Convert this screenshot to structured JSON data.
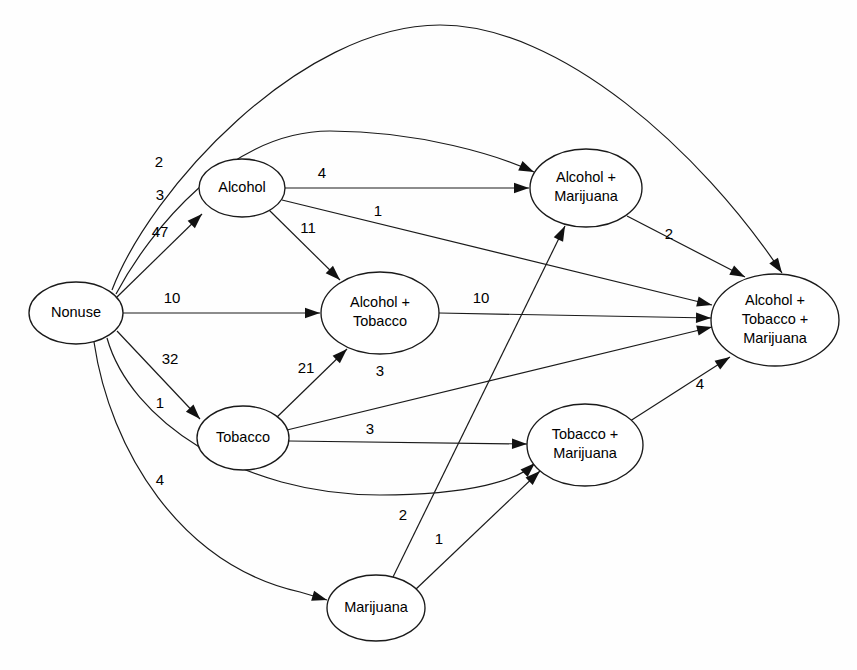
{
  "figure": {
    "type": "directed-transition-graph",
    "background_color": "#fefefe",
    "line_color": "#1a1a1a",
    "text_color": "#000000"
  },
  "nodes": [
    {
      "id": "nonuse",
      "label": "Nonuse",
      "lines": [
        "Nonuse"
      ],
      "cx": 76,
      "cy": 313,
      "rx": 47,
      "ry": 31
    },
    {
      "id": "alcohol",
      "label": "Alcohol",
      "lines": [
        "Alcohol"
      ],
      "cx": 242,
      "cy": 188,
      "rx": 43,
      "ry": 29
    },
    {
      "id": "alc_tob",
      "label": "Alcohol + Tobacco",
      "lines": [
        "Alcohol +",
        "Tobacco"
      ],
      "cx": 380,
      "cy": 313,
      "rx": 59,
      "ry": 41
    },
    {
      "id": "alc_mar",
      "label": "Alcohol + Marijuana",
      "lines": [
        "Alcohol +",
        "Marijuana"
      ],
      "cx": 586,
      "cy": 188,
      "rx": 56,
      "ry": 39
    },
    {
      "id": "atm",
      "label": "Alcohol + Tobacco + Marijuana",
      "lines": [
        "Alcohol +",
        "Tobacco +",
        "Marijuana"
      ],
      "cx": 775,
      "cy": 320,
      "rx": 64,
      "ry": 46
    },
    {
      "id": "tobacco",
      "label": "Tobacco",
      "lines": [
        "Tobacco"
      ],
      "cx": 243,
      "cy": 438,
      "rx": 46,
      "ry": 32
    },
    {
      "id": "tob_mar",
      "label": "Tobacco + Marijuana",
      "lines": [
        "Tobacco +",
        "Marijuana"
      ],
      "cx": 585,
      "cy": 445,
      "rx": 58,
      "ry": 41
    },
    {
      "id": "marijuana",
      "label": "Marijuana",
      "lines": [
        "Marijuana"
      ],
      "cx": 376,
      "cy": 608,
      "rx": 49,
      "ry": 33
    }
  ],
  "edges": [
    {
      "id": "e1",
      "from": "nonuse",
      "to": "atm",
      "value": "2",
      "label_x": 159,
      "label_y": 163,
      "d": "M 112,290 C 150,190 300,25 440,25 C 560,25 700,150 782,273"
    },
    {
      "id": "e2",
      "from": "nonuse",
      "to": "alc_mar",
      "value": "3",
      "label_x": 160,
      "label_y": 196,
      "d": "M 116,294 C 150,230 230,131 330,131 C 420,131 500,156 534,172"
    },
    {
      "id": "e3",
      "from": "nonuse",
      "to": "alcohol",
      "value": "47",
      "label_x": 160,
      "label_y": 233,
      "d": "M 117,297 L 202,214"
    },
    {
      "id": "e4",
      "from": "nonuse",
      "to": "alc_tob",
      "value": "10",
      "label_x": 172,
      "label_y": 299,
      "d": "M 123,313 L 320,313"
    },
    {
      "id": "e5",
      "from": "nonuse",
      "to": "tobacco",
      "value": "32",
      "label_x": 170,
      "label_y": 360,
      "d": "M 117,331 L 200,419"
    },
    {
      "id": "e6",
      "from": "nonuse",
      "to": "tob_mar",
      "value": "1",
      "label_x": 160,
      "label_y": 404,
      "d": "M 107,338 C 130,420 240,495 380,495 C 470,495 520,480 535,463"
    },
    {
      "id": "e7",
      "from": "nonuse",
      "to": "marijuana",
      "value": "4",
      "label_x": 160,
      "label_y": 481,
      "d": "M 94,342 C 110,450 180,565 300,592 L 327,600"
    },
    {
      "id": "e8",
      "from": "alcohol",
      "to": "alc_mar",
      "value": "4",
      "label_x": 322,
      "label_y": 174,
      "d": "M 285,188 L 529,188"
    },
    {
      "id": "e9",
      "from": "alcohol",
      "to": "atm",
      "value": "1",
      "label_x": 378,
      "label_y": 212,
      "d": "M 282,200 L 712,305"
    },
    {
      "id": "e10",
      "from": "alcohol",
      "to": "alc_tob",
      "value": "11",
      "label_x": 308,
      "label_y": 229,
      "d": "M 268,209 L 340,280"
    },
    {
      "id": "e11",
      "from": "alc_tob",
      "to": "atm",
      "value": "10",
      "label_x": 481,
      "label_y": 299,
      "d": "M 439,313 L 711,318"
    },
    {
      "id": "e12",
      "from": "alc_mar",
      "to": "atm",
      "value": "2",
      "label_x": 669,
      "label_y": 235,
      "d": "M 627,216 L 745,277"
    },
    {
      "id": "e13",
      "from": "tobacco",
      "to": "alc_tob",
      "value": "21",
      "label_x": 306,
      "label_y": 369,
      "d": "M 275,419 L 347,349"
    },
    {
      "id": "e14",
      "from": "tobacco",
      "to": "atm",
      "value": "3",
      "label_x": 380,
      "label_y": 372,
      "d": "M 287,430 L 712,327"
    },
    {
      "id": "e15",
      "from": "tobacco",
      "to": "tob_mar",
      "value": "3",
      "label_x": 370,
      "label_y": 430,
      "d": "M 289,441 L 527,444"
    },
    {
      "id": "e16",
      "from": "tob_mar",
      "to": "atm",
      "value": "4",
      "label_x": 700,
      "label_y": 385,
      "d": "M 627,423 L 730,357"
    },
    {
      "id": "e17",
      "from": "marijuana",
      "to": "alc_mar",
      "value": "2",
      "label_x": 403,
      "label_y": 516,
      "d": "M 393,577 L 565,226"
    },
    {
      "id": "e18",
      "from": "marijuana",
      "to": "tob_mar",
      "value": "1",
      "label_x": 439,
      "label_y": 540,
      "d": "M 415,590 L 540,471"
    }
  ],
  "chart_data": {
    "type": "diagram",
    "title": "",
    "states": [
      "Nonuse",
      "Alcohol",
      "Tobacco",
      "Marijuana",
      "Alcohol + Tobacco",
      "Alcohol + Marijuana",
      "Tobacco + Marijuana",
      "Alcohol + Tobacco + Marijuana"
    ],
    "transitions": [
      {
        "source": "Nonuse",
        "target": "Alcohol + Tobacco + Marijuana",
        "count": 2
      },
      {
        "source": "Nonuse",
        "target": "Alcohol + Marijuana",
        "count": 3
      },
      {
        "source": "Nonuse",
        "target": "Alcohol",
        "count": 47
      },
      {
        "source": "Nonuse",
        "target": "Alcohol + Tobacco",
        "count": 10
      },
      {
        "source": "Nonuse",
        "target": "Tobacco",
        "count": 32
      },
      {
        "source": "Nonuse",
        "target": "Tobacco + Marijuana",
        "count": 1
      },
      {
        "source": "Nonuse",
        "target": "Marijuana",
        "count": 4
      },
      {
        "source": "Alcohol",
        "target": "Alcohol + Marijuana",
        "count": 4
      },
      {
        "source": "Alcohol",
        "target": "Alcohol + Tobacco + Marijuana",
        "count": 1
      },
      {
        "source": "Alcohol",
        "target": "Alcohol + Tobacco",
        "count": 11
      },
      {
        "source": "Alcohol + Tobacco",
        "target": "Alcohol + Tobacco + Marijuana",
        "count": 10
      },
      {
        "source": "Alcohol + Marijuana",
        "target": "Alcohol + Tobacco + Marijuana",
        "count": 2
      },
      {
        "source": "Tobacco",
        "target": "Alcohol + Tobacco",
        "count": 21
      },
      {
        "source": "Tobacco",
        "target": "Alcohol + Tobacco + Marijuana",
        "count": 3
      },
      {
        "source": "Tobacco",
        "target": "Tobacco + Marijuana",
        "count": 3
      },
      {
        "source": "Tobacco + Marijuana",
        "target": "Alcohol + Tobacco + Marijuana",
        "count": 4
      },
      {
        "source": "Marijuana",
        "target": "Alcohol + Marijuana",
        "count": 2
      },
      {
        "source": "Marijuana",
        "target": "Tobacco + Marijuana",
        "count": 1
      }
    ]
  }
}
